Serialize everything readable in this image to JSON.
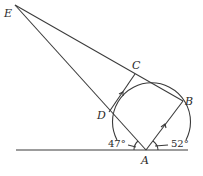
{
  "diagram": {
    "type": "geometry",
    "points": {
      "E": {
        "label": "E",
        "x": 15,
        "y": 5
      },
      "C": {
        "label": "C",
        "x": 135,
        "y": 74
      },
      "B": {
        "label": "B",
        "x": 183,
        "y": 101
      },
      "D": {
        "label": "D",
        "x": 109,
        "y": 112
      },
      "A": {
        "label": "A",
        "x": 146,
        "y": 150
      }
    },
    "angles": {
      "left": {
        "label": "47°"
      },
      "right": {
        "label": "52°"
      }
    },
    "parallel_marks": [
      "DC",
      "AB"
    ],
    "colors": {
      "stroke": "#3a3a3a",
      "text": "#2a2a2a",
      "background": "#ffffff"
    }
  }
}
